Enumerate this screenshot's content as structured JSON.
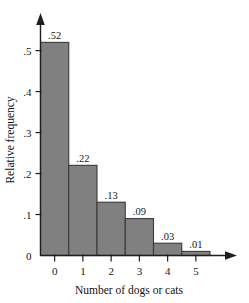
{
  "chart_data": {
    "type": "bar",
    "title": "",
    "subtitle": "",
    "xlabel": "Number of dogs or cats",
    "ylabel": "Relative frequency",
    "categories": [
      "0",
      "1",
      "2",
      "3",
      "4",
      "5"
    ],
    "values": [
      0.52,
      0.22,
      0.13,
      0.09,
      0.03,
      0.01
    ],
    "value_labels": [
      ".52",
      ".22",
      ".13",
      ".09",
      ".03",
      ".01"
    ],
    "xlim": [
      -0.5,
      5.5
    ],
    "ylim": [
      0,
      0.56
    ],
    "yticks": [
      0,
      0.1,
      0.2,
      0.3,
      0.4,
      0.5
    ],
    "ytick_labels": [
      "0",
      ".1",
      ".2",
      ".3",
      ".4",
      ".5"
    ],
    "xticks": [
      0,
      1,
      2,
      3,
      4,
      5
    ],
    "xtick_labels": [
      "0",
      "1",
      "2",
      "3",
      "4",
      "5"
    ],
    "grid": false,
    "legend": null,
    "legend_position": "none",
    "bar_fill_color": "#808080",
    "bar_edge_color": "#3a3a3a",
    "axis_color": "#1e1e1e",
    "background_color": "#ffffff",
    "bars_contiguous": true,
    "axis_arrows": [
      "y-up",
      "x-right"
    ]
  }
}
